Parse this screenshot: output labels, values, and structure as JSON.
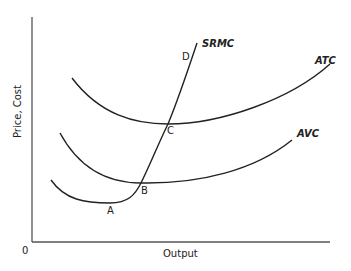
{
  "diagram": {
    "axes": {
      "y_label": "Price, Cost",
      "x_label": "Output",
      "origin_label": "0"
    },
    "curves": [
      {
        "id": "atc",
        "label": "ATC"
      },
      {
        "id": "avc",
        "label": "AVC"
      },
      {
        "id": "srmc",
        "label": "SRMC"
      }
    ],
    "points": [
      {
        "id": "A",
        "label": "A"
      },
      {
        "id": "B",
        "label": "B"
      },
      {
        "id": "C",
        "label": "C"
      },
      {
        "id": "D",
        "label": "D"
      }
    ],
    "colors": {
      "line": "#222222",
      "axis": "#555555",
      "background": "#ffffff"
    }
  }
}
